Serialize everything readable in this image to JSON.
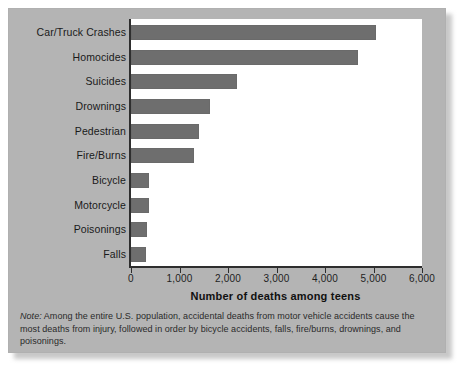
{
  "chart_data": {
    "type": "bar",
    "orientation": "horizontal",
    "title": "",
    "xlabel": "Number of deaths among teens",
    "ylabel": "",
    "xlim": [
      0,
      6000
    ],
    "grid": false,
    "legend": "none",
    "xticks": [
      0,
      1000,
      2000,
      3000,
      4000,
      5000,
      6000
    ],
    "xtick_labels": [
      "0",
      "1,000",
      "2,000",
      "3,000",
      "4,000",
      "5,000",
      "6,000"
    ],
    "categories": [
      "Car/Truck Crashes",
      "Homocides",
      "Suicides",
      "Drownings",
      "Pedestrian",
      "Fire/Burns",
      "Bicycle",
      "Motorcycle",
      "Poisonings",
      "Falls"
    ],
    "values": [
      5050,
      4680,
      2180,
      1630,
      1400,
      1300,
      370,
      370,
      330,
      300
    ],
    "bar_color": "#6e6e6e",
    "plot_background": "#ffffff",
    "panel_background": "#b4b4b4"
  },
  "note": {
    "lead": "Note:",
    "text": " Among the entire U.S. population, accidental deaths from motor vehicle accidents cause the most deaths from injury, followed in order by bicycle accidents, falls, fire/burns, drownings, and poisonings."
  }
}
